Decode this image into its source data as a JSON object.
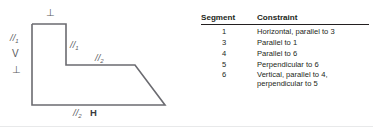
{
  "figure": {
    "diagram": {
      "name": "stepped-polygon-outline",
      "outline_color": "#6b6b70",
      "labels": [
        {
          "id": "top-perpendicular",
          "text": "⊥",
          "kind": "symbol"
        },
        {
          "id": "left-parallel-1",
          "text": "//",
          "sub": "1",
          "kind": "parallel"
        },
        {
          "id": "left-vertical-v",
          "text": "V",
          "kind": "symbol"
        },
        {
          "id": "left-perpendicular",
          "text": "⊥",
          "kind": "symbol"
        },
        {
          "id": "inner-parallel-1",
          "text": "//",
          "sub": "1",
          "kind": "parallel"
        },
        {
          "id": "mid-parallel-2",
          "text": "//",
          "sub": "2",
          "kind": "parallel"
        },
        {
          "id": "bottom-parallel-2",
          "text": "//",
          "sub": "2",
          "kind": "parallel"
        },
        {
          "id": "bottom-horizontal-h",
          "text": "H",
          "kind": "symbol"
        }
      ]
    },
    "table": {
      "headers": [
        "Segment",
        "Constraint"
      ],
      "rows": [
        {
          "segment": "1",
          "constraint": "Horizontal, parallel to 3"
        },
        {
          "segment": "3",
          "constraint": "Parallel to 1"
        },
        {
          "segment": "4",
          "constraint": "Parallel to 6"
        },
        {
          "segment": "5",
          "constraint": "Perpendicular to 6"
        },
        {
          "segment": "6",
          "constraint": "Vertical, parallel to 4,\nperpendicular to 5"
        }
      ]
    }
  }
}
